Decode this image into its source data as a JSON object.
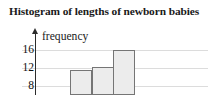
{
  "chart_data": {
    "type": "bar",
    "title": "Histogram of lengths of newborn babies",
    "xlabel": "",
    "ylabel": "frequency",
    "categories": [
      "bin-1",
      "bin-2",
      "bin-3"
    ],
    "values": [
      9,
      10,
      16
    ],
    "ytick_labels": [
      "16",
      "12",
      "8"
    ],
    "ytick_values": [
      16,
      12,
      8
    ],
    "ylim": [
      0,
      18
    ],
    "grid": true,
    "legend": "none",
    "colors": {
      "bar_fill": "#ececec",
      "bar_stroke": "#757575",
      "gridline": "#dcdcdc",
      "axis": "#2b2b2b",
      "text": "#1a1a1a"
    }
  },
  "chart": {
    "title": "Histogram of lengths of newborn babies",
    "y_axis_label": "frequency",
    "ticks": {
      "t16": "16",
      "t12": "12",
      "t8": "8"
    }
  }
}
